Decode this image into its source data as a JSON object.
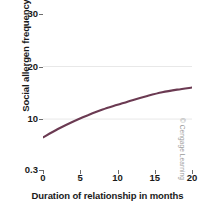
{
  "chart_data": {
    "type": "line",
    "title": "",
    "xlabel": "Duration of relationship in months",
    "ylabel": "Social allergen frequency",
    "xlim": [
      0,
      20
    ],
    "ylim": [
      0.3,
      30
    ],
    "xticks": [
      "0",
      "5",
      "10",
      "15",
      "20"
    ],
    "xtick_values": [
      0,
      5,
      10,
      15,
      20
    ],
    "yticks": [
      "0.3",
      "10",
      "20",
      "30"
    ],
    "ytick_values": [
      0.3,
      10,
      20,
      30
    ],
    "grid": "horizontal-faint",
    "legend": "none",
    "series": [
      {
        "name": "Social allergen frequency",
        "color": "#6b3a52",
        "x": [
          0,
          2,
          4,
          6,
          8,
          10,
          12,
          14,
          16,
          18,
          20
        ],
        "values": [
          6.5,
          8.1,
          9.5,
          10.7,
          11.8,
          12.7,
          13.6,
          14.4,
          15.1,
          15.6,
          16.0
        ]
      }
    ]
  },
  "credit": "© Cengage Learning",
  "colors": {
    "curve": "#6b3a52",
    "frame": "#6d6d6d",
    "grid": "#e8e8e8",
    "text": "#1a1a1a",
    "background": "#ffffff"
  }
}
